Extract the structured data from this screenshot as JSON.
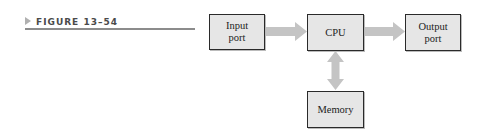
{
  "figure": {
    "label": "FIGURE 13–54"
  },
  "diagram": {
    "nodes": [
      {
        "id": "input",
        "label": "Input\nport"
      },
      {
        "id": "cpu",
        "label": "CPU"
      },
      {
        "id": "output",
        "label": "Output\nport"
      },
      {
        "id": "memory",
        "label": "Memory"
      }
    ],
    "edges": [
      {
        "from": "input",
        "to": "cpu",
        "direction": "one-way"
      },
      {
        "from": "cpu",
        "to": "output",
        "direction": "one-way"
      },
      {
        "from": "cpu",
        "to": "memory",
        "direction": "two-way"
      }
    ],
    "colors": {
      "box_fill": "#e6e6e6",
      "box_border": "#2a2a2a",
      "arrow": "#c4c4c4"
    }
  }
}
